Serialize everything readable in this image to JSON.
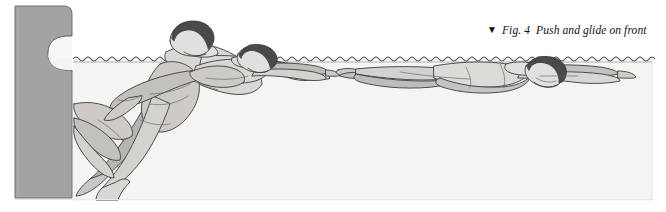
{
  "figure": {
    "caption": {
      "marker_icon": "down-triangle-icon",
      "marker_glyph": "▼",
      "figure_number": "Fig. 4",
      "title": "Push and glide on front",
      "full_text": "▼  Fig. 4  Push and glide on front"
    },
    "scene": {
      "description": "Line illustration of a swimmer pushing off a pool wall and gliding on the front through three sequential positions",
      "water_label": "water",
      "wall_label": "pool wall with rounded handhold notch",
      "waterline_label": "water surface"
    },
    "swimmers": [
      {
        "id": "swimmer-1",
        "label": "Push off from wall",
        "phase": "push",
        "head_position": "above water",
        "hair": "dark"
      },
      {
        "id": "swimmer-2",
        "label": "Entering glide",
        "phase": "transition",
        "head_position": "at surface",
        "hair": "dark"
      },
      {
        "id": "swimmer-3",
        "label": "Streamlined glide on front",
        "phase": "glide",
        "head_position": "below surface",
        "hair": "dark"
      }
    ],
    "colors": {
      "wall": "#a3a3a3",
      "wall_outline": "#6e6e6e",
      "water": "#f4f4f2",
      "water_edge": "#8d8d8d",
      "body_light": "#e2e0de",
      "body_mid": "#c3c1bd",
      "body_shade": "#a6a4a0",
      "hair_dark": "#4a4a4a",
      "outline": "#3c3c3c",
      "page_background": "#ffffff",
      "caption_text": "#111111"
    }
  }
}
